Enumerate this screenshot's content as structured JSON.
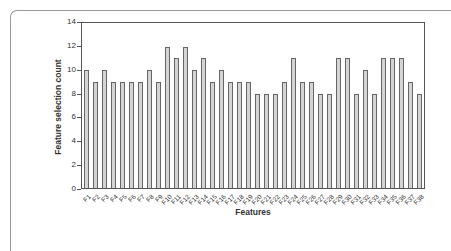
{
  "chart_data": {
    "type": "bar",
    "title": "",
    "xlabel": "Features",
    "ylabel": "Feature selection count",
    "ylim": [
      0,
      14
    ],
    "yticks": [
      0,
      2,
      4,
      6,
      8,
      10,
      12,
      14
    ],
    "grid": false,
    "legend": null,
    "bar_color": "#d4d4d4",
    "bar_edge_color": "#666666",
    "categories": [
      "F1",
      "F2",
      "F3",
      "F4",
      "F5",
      "F6",
      "F7",
      "F8",
      "F9",
      "F10",
      "F11",
      "F12",
      "F13",
      "F14",
      "F15",
      "F16",
      "F17",
      "F18",
      "F19",
      "F20",
      "F21",
      "F22",
      "F23",
      "F24",
      "F25",
      "F26",
      "F27",
      "F28",
      "F29",
      "F30",
      "F31",
      "F32",
      "F33",
      "F34",
      "F35",
      "F36",
      "F37",
      "F38"
    ],
    "values": [
      10,
      9,
      10,
      9,
      9,
      9,
      9,
      10,
      9,
      12,
      11,
      12,
      10,
      11,
      9,
      10,
      9,
      9,
      9,
      8,
      8,
      8,
      9,
      11,
      9,
      9,
      8,
      8,
      11,
      11,
      8,
      10,
      8,
      11,
      11,
      11,
      9,
      8
    ]
  }
}
